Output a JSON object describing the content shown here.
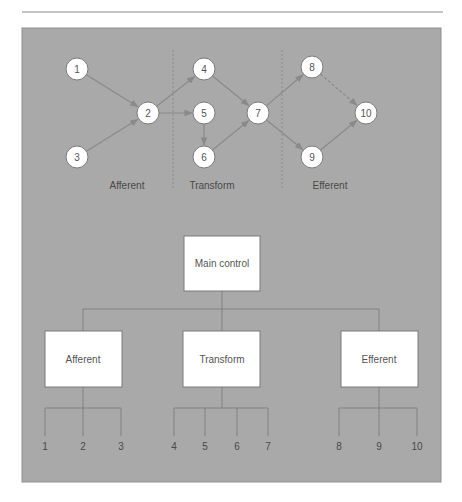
{
  "colors": {
    "panel_background": "#a9a9a9",
    "panel_border": "#8f8f8f",
    "top_rule": "#8a8a8a",
    "node_fill": "#ffffff",
    "edge": "#8a8a8a"
  },
  "flow_graph": {
    "nodes": [
      {
        "id": "1",
        "label": "1",
        "x": 77,
        "y": 69
      },
      {
        "id": "2",
        "label": "2",
        "x": 148,
        "y": 113
      },
      {
        "id": "3",
        "label": "3",
        "x": 77,
        "y": 157
      },
      {
        "id": "4",
        "label": "4",
        "x": 204,
        "y": 69
      },
      {
        "id": "5",
        "label": "5",
        "x": 204,
        "y": 113
      },
      {
        "id": "6",
        "label": "6",
        "x": 204,
        "y": 157
      },
      {
        "id": "7",
        "label": "7",
        "x": 258,
        "y": 113
      },
      {
        "id": "8",
        "label": "8",
        "x": 312,
        "y": 67
      },
      {
        "id": "9",
        "label": "9",
        "x": 312,
        "y": 157
      },
      {
        "id": "10",
        "label": "10",
        "x": 366,
        "y": 113
      }
    ],
    "edges": [
      {
        "from": "1",
        "to": "2",
        "style": "solid"
      },
      {
        "from": "3",
        "to": "2",
        "style": "solid"
      },
      {
        "from": "2",
        "to": "4",
        "style": "solid"
      },
      {
        "from": "2",
        "to": "5",
        "style": "solid"
      },
      {
        "from": "5",
        "to": "6",
        "style": "solid"
      },
      {
        "from": "4",
        "to": "7",
        "style": "solid"
      },
      {
        "from": "6",
        "to": "7",
        "style": "solid"
      },
      {
        "from": "7",
        "to": "8",
        "style": "solid"
      },
      {
        "from": "7",
        "to": "9",
        "style": "solid"
      },
      {
        "from": "8",
        "to": "10",
        "style": "dashed"
      },
      {
        "from": "9",
        "to": "10",
        "style": "solid"
      }
    ],
    "region_labels": [
      {
        "label": "Afferent",
        "x": 127,
        "y": 189
      },
      {
        "label": "Transform",
        "x": 212,
        "y": 189
      },
      {
        "label": "Efferent",
        "x": 330,
        "y": 189
      }
    ]
  },
  "structure_chart": {
    "root": {
      "label": "Main control"
    },
    "modules": [
      {
        "label": "Afferent",
        "leaves": [
          "1",
          "2",
          "3"
        ]
      },
      {
        "label": "Transform",
        "leaves": [
          "4",
          "5",
          "6",
          "7"
        ]
      },
      {
        "label": "Efferent",
        "leaves": [
          "8",
          "9",
          "10"
        ]
      }
    ]
  }
}
